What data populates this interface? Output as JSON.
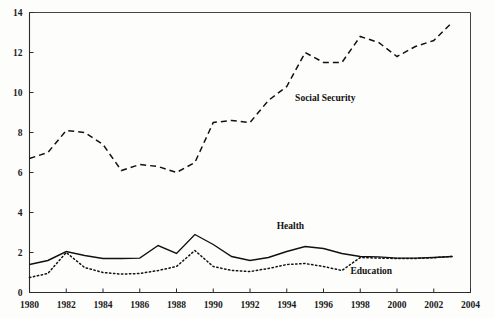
{
  "chart_data": {
    "type": "line",
    "title": "",
    "xlabel": "",
    "ylabel": "",
    "xlim": [
      1980,
      2004
    ],
    "ylim": [
      0,
      14
    ],
    "grid": false,
    "legend_position": "inline-annotations",
    "xticks": [
      "1980",
      "1982",
      "1984",
      "1986",
      "1988",
      "1990",
      "1992",
      "1994",
      "1996",
      "1998",
      "2000",
      "2002",
      "2004"
    ],
    "yticks": [
      "0",
      "2",
      "4",
      "6",
      "8",
      "10",
      "12",
      "14"
    ],
    "x": [
      1980,
      1981,
      1982,
      1983,
      1984,
      1985,
      1986,
      1987,
      1988,
      1989,
      1990,
      1991,
      1992,
      1993,
      1994,
      1995,
      1996,
      1997,
      1998,
      1999,
      2000,
      2001,
      2002,
      2003
    ],
    "series": [
      {
        "name": "Social Security",
        "style": "dashed",
        "values": [
          6.7,
          7.0,
          8.1,
          8.0,
          7.4,
          6.1,
          6.4,
          6.3,
          6.0,
          6.5,
          8.5,
          8.6,
          8.5,
          9.6,
          10.3,
          12.0,
          11.5,
          11.5,
          12.8,
          12.5,
          11.8,
          12.3,
          12.6,
          13.5
        ]
      },
      {
        "name": "Health",
        "style": "solid",
        "values": [
          1.4,
          1.6,
          2.05,
          1.85,
          1.7,
          1.7,
          1.72,
          2.35,
          1.95,
          2.9,
          2.4,
          1.8,
          1.6,
          1.75,
          2.05,
          2.3,
          2.2,
          1.95,
          1.8,
          1.78,
          1.72,
          1.72,
          1.75,
          1.8
        ]
      },
      {
        "name": "Education",
        "style": "dotted",
        "values": [
          0.75,
          0.95,
          2.0,
          1.25,
          1.0,
          0.92,
          0.95,
          1.1,
          1.3,
          2.1,
          1.3,
          1.1,
          1.05,
          1.2,
          1.4,
          1.45,
          1.3,
          1.1,
          1.75,
          1.72,
          1.7,
          1.7,
          1.74,
          1.8
        ]
      }
    ],
    "annotations": [
      {
        "text": "Social Security",
        "x": 1996.1,
        "y": 9.6
      },
      {
        "text": "Health",
        "x": 1994.2,
        "y": 3.2
      },
      {
        "text": "Education",
        "x": 1998.6,
        "y": 0.92
      }
    ]
  }
}
